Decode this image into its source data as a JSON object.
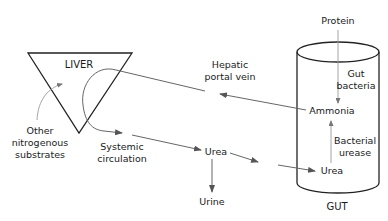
{
  "diagram": {
    "organs": {
      "liver": "LIVER",
      "gut": "GUT"
    },
    "labels": {
      "protein": "Protein",
      "gut_bacteria_line1": "Gut",
      "gut_bacteria_line2": "bacteria",
      "ammonia": "Ammonia",
      "bacterial_urease_line1": "Bacterial",
      "bacterial_urease_line2": "urease",
      "urea_gut": "Urea",
      "hepatic_line1": "Hepatic",
      "hepatic_line2": "portal vein",
      "systemic_line1": "Systemic",
      "systemic_line2": "circulation",
      "urea_blood": "Urea",
      "urine": "Urine",
      "other_line1": "Other",
      "other_line2": "nitrogenous",
      "other_line3": "substrates"
    },
    "colors": {
      "outline": "#222222",
      "flow": "#666666",
      "text": "#1a1a1a",
      "background": "#ffffff"
    }
  }
}
